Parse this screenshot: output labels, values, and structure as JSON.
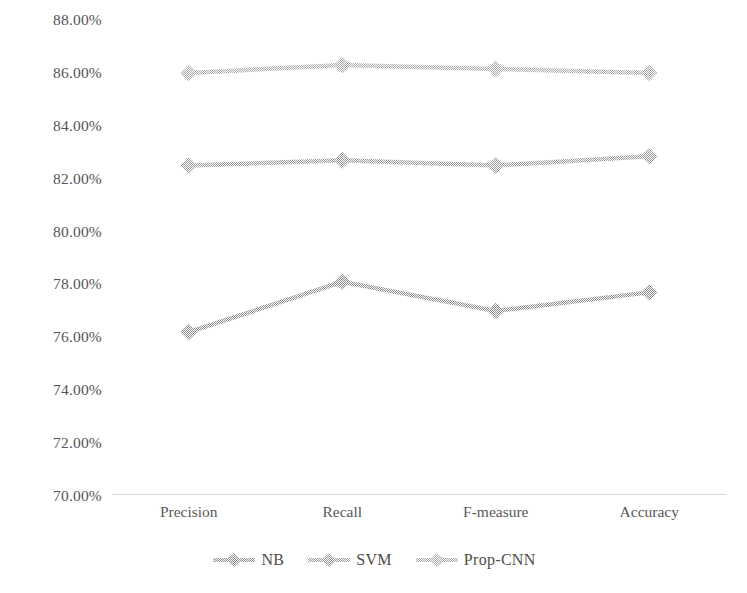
{
  "chart_data": {
    "type": "line",
    "title": "",
    "subtitle": "",
    "xlabel": "",
    "ylabel": "",
    "categories": [
      "Precision",
      "Recall",
      "F-measure",
      "Accuracy"
    ],
    "series": [
      {
        "name": "NB",
        "values": [
          76.2,
          78.1,
          77.0,
          77.7
        ],
        "color": "#8c8c8a"
      },
      {
        "name": "SVM",
        "values": [
          82.5,
          82.7,
          82.5,
          82.85
        ],
        "color": "#9a9a98"
      },
      {
        "name": "Prop-CNN",
        "values": [
          86.0,
          86.3,
          86.15,
          86.0
        ],
        "color": "#a9a9a7"
      }
    ],
    "ylim": [
      70,
      88
    ],
    "ytick_step": 2,
    "ytick_labels": [
      "88.00%",
      "86.00%",
      "84.00%",
      "82.00%",
      "80.00%",
      "78.00%",
      "76.00%",
      "74.00%",
      "72.00%",
      "70.00%"
    ],
    "ytick_values": [
      88,
      86,
      84,
      82,
      80,
      78,
      76,
      74,
      72,
      70
    ],
    "grid": false,
    "legend_position": "bottom",
    "legend_entries": [
      "NB",
      "SVM",
      "Prop-CNN"
    ],
    "marker": "diamond",
    "axis_color": "#d8d8d6"
  }
}
